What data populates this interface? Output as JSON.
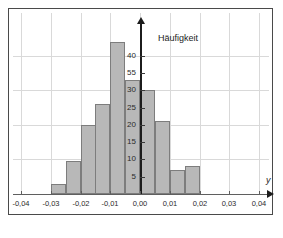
{
  "chart_data": {
    "type": "bar",
    "title": "",
    "subtitle": "",
    "xlabel": "y",
    "ylabel": "Häufigkeit",
    "grid": true,
    "legend": "none",
    "xlim": [
      -0.04,
      0.04
    ],
    "ylim": [
      0,
      46
    ],
    "bin_width": 0.005,
    "xtick_labels": [
      "-0,04",
      "-0,03",
      "-0,02",
      "-0,01",
      "0,00",
      "0,01",
      "0,02",
      "0,03",
      "0,04"
    ],
    "xtick_values": [
      -0.04,
      -0.03,
      -0.02,
      -0.01,
      0.0,
      0.01,
      0.02,
      0.03,
      0.04
    ],
    "ytick_labels": [
      "5",
      "10",
      "15",
      "20",
      "25",
      "30",
      "55",
      "40"
    ],
    "ytick_values": [
      5,
      10,
      15,
      20,
      25,
      30,
      35,
      40
    ],
    "hgrid_values": [
      10,
      20,
      30,
      40
    ],
    "categories": [
      "-0,030 – -0,025",
      "-0,025 – -0,020",
      "-0,020 – -0,015",
      "-0,015 – -0,010",
      "-0,010 – -0,005",
      "-0,005 – 0,000",
      "0,000 – 0,005",
      "0,005 – 0,010",
      "0,010 – 0,015",
      "0,015 – 0,020"
    ],
    "bin_starts": [
      -0.03,
      -0.025,
      -0.02,
      -0.015,
      -0.01,
      -0.005,
      0.0,
      0.005,
      0.01,
      0.015
    ],
    "values": [
      3,
      9.5,
      20,
      26,
      44,
      33,
      30,
      21,
      7,
      8
    ],
    "bar_fill": "#b8b8b8",
    "bar_border": "#7d7d7d",
    "grid_color": "#d9d9d9",
    "axis_color": "#1c1c1c",
    "frame_color": "#4a4a4a",
    "background": "#ffffff"
  }
}
